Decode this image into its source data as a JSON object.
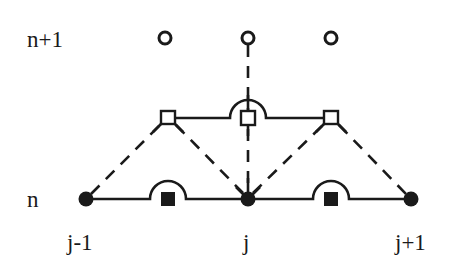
{
  "diagram": {
    "title": "",
    "time_levels": [
      {
        "label": "n+1",
        "x": 27,
        "y": 47
      },
      {
        "label": "n",
        "x": 27,
        "y": 207
      }
    ],
    "space_indices": [
      {
        "label": "j-1",
        "x": 67,
        "y": 250
      },
      {
        "label": "j",
        "x": 243,
        "y": 250
      },
      {
        "label": "j+1",
        "x": 395,
        "y": 250
      }
    ],
    "nodes_level_n": [
      {
        "id": "j-1",
        "x": 86,
        "y": 199,
        "type": "filled-circle"
      },
      {
        "id": "j",
        "x": 248,
        "y": 199,
        "type": "filled-circle"
      },
      {
        "id": "j+1",
        "x": 411,
        "y": 199,
        "type": "filled-circle"
      }
    ],
    "nodes_level_n_plus_1": [
      {
        "id": "j-1/2",
        "x": 165,
        "y": 38,
        "type": "open-circle"
      },
      {
        "id": "j",
        "x": 248,
        "y": 38,
        "type": "open-circle"
      },
      {
        "id": "j+1/2",
        "x": 331,
        "y": 38,
        "type": "open-circle"
      }
    ],
    "half_step_nodes": [
      {
        "id": "j-1/2, n+1/2",
        "x": 168,
        "y": 118,
        "type": "open-square"
      },
      {
        "id": "j, n+1/2",
        "x": 248,
        "y": 118,
        "type": "open-square"
      },
      {
        "id": "j+1/2, n+1/2",
        "x": 331,
        "y": 118,
        "type": "open-square"
      }
    ],
    "cell_centers_level_n": [
      {
        "id": "j-1/2",
        "x": 168,
        "y": 199,
        "type": "filled-square"
      },
      {
        "id": "j+1/2",
        "x": 331,
        "y": 199,
        "type": "filled-square"
      }
    ],
    "line_color": "#1a1a1a",
    "background": "#ffffff"
  }
}
